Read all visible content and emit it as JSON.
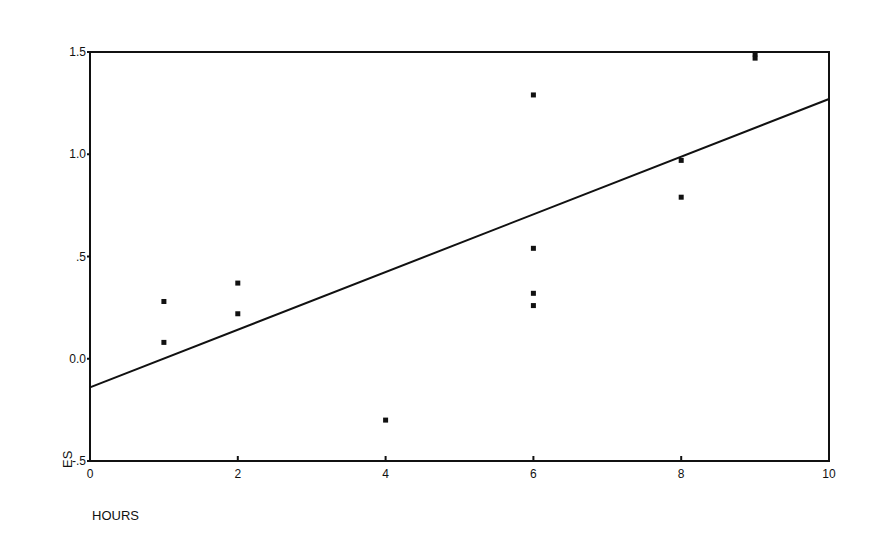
{
  "chart_data": {
    "type": "scatter",
    "title": "",
    "xlabel": "HOURS",
    "ylabel": "ES",
    "xlim": [
      0,
      10
    ],
    "ylim": [
      -0.5,
      1.5
    ],
    "x_ticks": [
      0,
      2,
      4,
      6,
      8,
      10
    ],
    "x_tick_labels": [
      "0",
      "2",
      "4",
      "6",
      "8",
      "10"
    ],
    "y_ticks": [
      -0.5,
      0.0,
      0.5,
      1.0,
      1.5
    ],
    "y_tick_labels": [
      "-.5",
      "0.0",
      ".5",
      "1.0",
      "1.5"
    ],
    "grid": false,
    "legend": null,
    "series": [
      {
        "name": "observations",
        "type": "scatter",
        "points": [
          {
            "x": 1,
            "y": 0.28
          },
          {
            "x": 1,
            "y": 0.08
          },
          {
            "x": 2,
            "y": 0.37
          },
          {
            "x": 2,
            "y": 0.22
          },
          {
            "x": 4,
            "y": -0.3
          },
          {
            "x": 6,
            "y": 1.29
          },
          {
            "x": 6,
            "y": 0.54
          },
          {
            "x": 6,
            "y": 0.32
          },
          {
            "x": 6,
            "y": 0.26
          },
          {
            "x": 8,
            "y": 0.97
          },
          {
            "x": 8,
            "y": 0.79
          },
          {
            "x": 9,
            "y": 1.49
          },
          {
            "x": 9,
            "y": 1.47
          }
        ]
      },
      {
        "name": "regression line",
        "type": "line",
        "points": [
          {
            "x": 0,
            "y": -0.14
          },
          {
            "x": 10,
            "y": 1.27
          }
        ]
      }
    ]
  },
  "colors": {
    "ink": "#111111",
    "background": "#ffffff"
  }
}
